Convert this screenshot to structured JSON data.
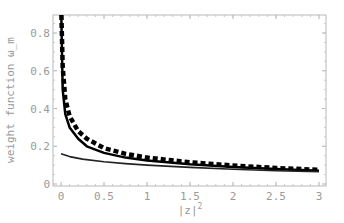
{
  "chart_data": {
    "type": "line",
    "title": "",
    "xlabel": "|z|^2",
    "ylabel": "weight function ω_m",
    "xlim": [
      0,
      3
    ],
    "ylim": [
      0,
      0.9
    ],
    "grid": false,
    "legend": null,
    "x_ticks": [
      "0",
      "0.5",
      "1",
      "1.5",
      "2",
      "2.5",
      "3"
    ],
    "y_ticks": [
      "0",
      "0.2",
      "0.4",
      "0.6",
      "0.8"
    ],
    "series": [
      {
        "name": "dashed thick curve",
        "style": "dashed",
        "x": [
          0.005,
          0.02,
          0.05,
          0.1,
          0.2,
          0.3,
          0.5,
          0.75,
          1.0,
          1.5,
          2.0,
          2.5,
          3.0
        ],
        "values": [
          0.9,
          0.62,
          0.45,
          0.36,
          0.28,
          0.24,
          0.19,
          0.16,
          0.14,
          0.115,
          0.098,
          0.085,
          0.075
        ]
      },
      {
        "name": "solid thick curve",
        "style": "solid",
        "x": [
          0.003,
          0.02,
          0.05,
          0.1,
          0.2,
          0.3,
          0.5,
          0.75,
          1.0,
          1.5,
          2.0,
          2.5,
          3.0
        ],
        "values": [
          0.9,
          0.5,
          0.37,
          0.3,
          0.24,
          0.2,
          0.165,
          0.14,
          0.125,
          0.105,
          0.09,
          0.08,
          0.07
        ]
      },
      {
        "name": "thin solid curve",
        "style": "thin",
        "x": [
          0.0,
          0.1,
          0.25,
          0.5,
          0.75,
          1.0,
          1.5,
          2.0,
          2.5,
          3.0
        ],
        "values": [
          0.16,
          0.145,
          0.132,
          0.118,
          0.108,
          0.1,
          0.088,
          0.078,
          0.07,
          0.065
        ]
      }
    ]
  }
}
